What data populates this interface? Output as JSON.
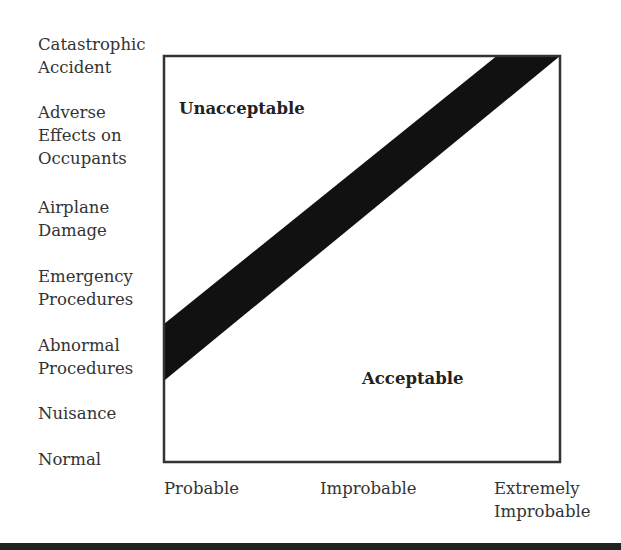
{
  "diagram": {
    "title": "",
    "y_axis": {
      "label": "Severity",
      "categories": [
        "Catastrophic Accident",
        "Adverse Effects on Occupants",
        "Airplane Damage",
        "Emergency Procedures",
        "Abnormal Procedures",
        "Nuisance",
        "Normal"
      ],
      "labels_display": [
        [
          "Catastrophic",
          "Accident"
        ],
        [
          "Adverse",
          "Effects on",
          "Occupants"
        ],
        [
          "Airplane",
          "Damage"
        ],
        [
          "Emergency",
          "Procedures"
        ],
        [
          "Abnormal",
          "Procedures"
        ],
        [
          "Nuisance"
        ],
        [
          "Normal"
        ]
      ]
    },
    "x_axis": {
      "label": "Probability",
      "categories": [
        "Probable",
        "Improbable",
        "Extremely Improbable"
      ],
      "labels_display": [
        [
          "Probable"
        ],
        [
          "Improbable"
        ],
        [
          "Extremely",
          "Improbable"
        ]
      ]
    },
    "regions": {
      "upper": "Unacceptable",
      "lower": "Acceptable"
    },
    "boundary_band": {
      "description": "Diagonal black band separating unacceptable (upper-left) from acceptable (lower-right)",
      "color": "#111111",
      "left_edge_fraction_from_top": [
        0.66,
        0.8
      ],
      "top_edge_fraction_from_left": [
        0.84,
        1.0
      ]
    },
    "colors": {
      "frame": "#333333",
      "text": "#333333",
      "band": "#111111"
    }
  }
}
